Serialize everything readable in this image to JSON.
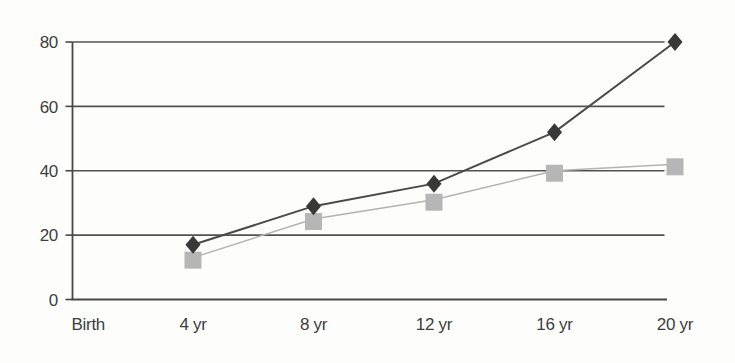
{
  "chart_data": {
    "type": "line",
    "title": "",
    "xlabel": "",
    "ylabel": "",
    "x_ticks": [
      "Birth",
      "4 yr",
      "8 yr",
      "12 yr",
      "16 yr",
      "20 yr"
    ],
    "y_ticks": [
      "0",
      "20",
      "40",
      "60",
      "80"
    ],
    "ylim": [
      0,
      80
    ],
    "grid": "horizontal-only",
    "legend": "none",
    "background_color": "#fdfdfc",
    "axis_color": "#474747",
    "grid_color": "#525252",
    "tick_label_color": "#3e3e3e",
    "series": [
      {
        "name": "lower-growth-series",
        "marker": "square",
        "marker_color": "#b6b6b6",
        "line_color": "#b3b3b3",
        "x_categories": [
          "4 yr",
          "8 yr",
          "12 yr",
          "16 yr",
          "20 yr"
        ],
        "values": [
          13,
          25,
          31,
          40,
          42
        ]
      },
      {
        "name": "upper-growth-series",
        "marker": "diamond",
        "marker_color": "#383838",
        "line_color": "#4a4a4a",
        "x_categories": [
          "4 yr",
          "8 yr",
          "12 yr",
          "16 yr",
          "20 yr"
        ],
        "values": [
          17,
          29,
          36,
          52,
          80
        ]
      }
    ]
  }
}
